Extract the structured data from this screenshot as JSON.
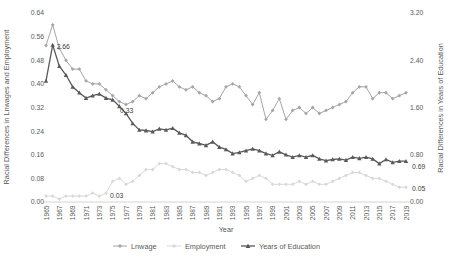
{
  "figure": {
    "left_axis_title": "Racial Differences in Lnwages and Employment",
    "right_axis_title": "Racial Differences in Years of Education",
    "x_axis_title": "Year"
  },
  "chart_data": {
    "type": "line",
    "x_start": 1965,
    "x_end": 2019,
    "x_step": 1,
    "x_tick_labels": [
      "1965",
      "1967",
      "1969",
      "1971",
      "1973",
      "1975",
      "1977",
      "1979",
      "1981",
      "1983",
      "1985",
      "1987",
      "1989",
      "1991",
      "1993",
      "1995",
      "1997",
      "1999",
      "2001",
      "2003",
      "2005",
      "2007",
      "2009",
      "2011",
      "2013",
      "2015",
      "2017",
      "2019"
    ],
    "left_axis": {
      "min": 0.0,
      "max": 0.64,
      "ticks": [
        "0.00",
        "0.08",
        "0.16",
        "0.24",
        "0.32",
        "0.40",
        "0.48",
        "0.56",
        "0.64"
      ]
    },
    "right_axis": {
      "min": 0.0,
      "max": 3.2,
      "ticks": [
        "0.00",
        "0.80",
        "1.60",
        "2.40",
        "3.20"
      ]
    },
    "grid": false,
    "legend_position": "bottom",
    "series": [
      {
        "name": "Lnwage",
        "axis": "left",
        "color": "#a6a6a6",
        "marker": "diamond",
        "line_width": 1,
        "values": [
          0.53,
          0.6,
          0.52,
          0.48,
          0.45,
          0.45,
          0.41,
          0.4,
          0.4,
          0.38,
          0.36,
          0.34,
          0.33,
          0.34,
          0.36,
          0.35,
          0.37,
          0.39,
          0.4,
          0.41,
          0.39,
          0.38,
          0.39,
          0.37,
          0.36,
          0.34,
          0.35,
          0.39,
          0.4,
          0.39,
          0.36,
          0.33,
          0.37,
          0.28,
          0.31,
          0.35,
          0.28,
          0.31,
          0.32,
          0.3,
          0.32,
          0.3,
          0.31,
          0.32,
          0.33,
          0.34,
          0.37,
          0.39,
          0.39,
          0.35,
          0.37,
          0.37,
          0.35,
          0.36,
          0.37
        ]
      },
      {
        "name": "Employment",
        "axis": "left",
        "color": "#d9d9d9",
        "marker": "diamond",
        "line_width": 1,
        "values": [
          0.02,
          0.02,
          0.01,
          0.02,
          0.02,
          0.02,
          0.02,
          0.03,
          0.02,
          0.03,
          0.07,
          0.08,
          0.06,
          0.07,
          0.09,
          0.11,
          0.11,
          0.13,
          0.13,
          0.12,
          0.11,
          0.11,
          0.1,
          0.1,
          0.09,
          0.1,
          0.11,
          0.11,
          0.1,
          0.09,
          0.07,
          0.08,
          0.09,
          0.08,
          0.06,
          0.06,
          0.06,
          0.06,
          0.07,
          0.06,
          0.07,
          0.06,
          0.06,
          0.07,
          0.08,
          0.09,
          0.1,
          0.1,
          0.09,
          0.08,
          0.08,
          0.07,
          0.06,
          0.05,
          0.05
        ]
      },
      {
        "name": "Years of Education",
        "axis": "right",
        "color": "#595959",
        "marker": "triangle",
        "line_width": 1.3,
        "values": [
          2.05,
          2.66,
          2.3,
          2.15,
          1.95,
          1.85,
          1.76,
          1.8,
          1.83,
          1.76,
          1.73,
          1.62,
          1.5,
          1.33,
          1.22,
          1.21,
          1.19,
          1.24,
          1.22,
          1.25,
          1.17,
          1.13,
          1.02,
          0.99,
          0.96,
          1.02,
          0.93,
          0.89,
          0.82,
          0.84,
          0.87,
          0.9,
          0.87,
          0.82,
          0.79,
          0.85,
          0.8,
          0.76,
          0.79,
          0.76,
          0.79,
          0.73,
          0.7,
          0.72,
          0.73,
          0.71,
          0.76,
          0.74,
          0.76,
          0.73,
          0.65,
          0.72,
          0.67,
          0.69,
          0.69
        ]
      }
    ],
    "annotations": [
      {
        "text": "2.66",
        "series": "Years of Education",
        "year": 1966,
        "dx": 4,
        "dy": 4
      },
      {
        "text": "0.33",
        "series": "Lnwage",
        "year": 1977,
        "dx": -6,
        "dy": 8
      },
      {
        "text": "0.03",
        "series": "Employment",
        "year": 1974,
        "dx": 4,
        "dy": 5
      },
      {
        "text": "0.69",
        "series": "Years of Education",
        "year": 2019,
        "dx": 6,
        "dy": 8
      },
      {
        "text": "0.05",
        "series": "Employment",
        "year": 2019,
        "dx": 6,
        "dy": 4
      }
    ]
  }
}
